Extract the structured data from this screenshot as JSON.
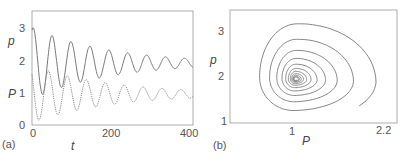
{
  "chart_data": [
    {
      "panel_label": "(a)",
      "type": "line",
      "title": "",
      "xlabel": "t",
      "ylabel_series": [
        "p",
        "P"
      ],
      "xlim": [
        0,
        400
      ],
      "ylim": [
        0,
        3.5
      ],
      "xticks": [
        "0",
        "200",
        "400"
      ],
      "yticks": [
        "0",
        "1",
        "2",
        "3"
      ],
      "grid": false,
      "legend": "none (series labeled on y-axis)",
      "series": [
        {
          "name": "p",
          "style": "solid",
          "description": "damped oscillation converging to ~1.9",
          "peaks": [
            [
              3,
              3.25
            ],
            [
              50,
              2.95
            ],
            [
              98,
              2.72
            ],
            [
              145,
              2.55
            ],
            [
              190,
              2.42
            ],
            [
              238,
              2.33
            ],
            [
              285,
              2.25
            ],
            [
              332,
              2.2
            ],
            [
              378,
              2.15
            ]
          ],
          "troughs": [
            [
              25,
              1.05
            ],
            [
              73,
              1.2
            ],
            [
              120,
              1.35
            ],
            [
              167,
              1.45
            ],
            [
              213,
              1.55
            ],
            [
              260,
              1.65
            ],
            [
              307,
              1.7
            ],
            [
              354,
              1.78
            ],
            [
              400,
              1.85
            ]
          ],
          "equilibrium": 1.9
        },
        {
          "name": "P",
          "style": "dotted",
          "description": "damped oscillation converging to ~0.95, lagging p",
          "peaks": [
            [
              0,
              2.15
            ],
            [
              40,
              1.85
            ],
            [
              88,
              1.65
            ],
            [
              135,
              1.48
            ],
            [
              182,
              1.38
            ],
            [
              228,
              1.3
            ],
            [
              276,
              1.25
            ],
            [
              322,
              1.2
            ],
            [
              370,
              1.18
            ]
          ],
          "troughs": [
            [
              20,
              0.4
            ],
            [
              68,
              0.48
            ],
            [
              115,
              0.58
            ],
            [
              162,
              0.65
            ],
            [
              208,
              0.72
            ],
            [
              255,
              0.78
            ],
            [
              302,
              0.82
            ],
            [
              348,
              0.86
            ],
            [
              400,
              0.92
            ]
          ],
          "equilibrium": 0.95
        }
      ]
    },
    {
      "panel_label": "(b)",
      "type": "line",
      "title": "",
      "xlabel": "P",
      "ylabel": "p",
      "xticks": [
        "1",
        "2.2"
      ],
      "yticks": [
        "1",
        "2",
        "3"
      ],
      "xlim": [
        0.1,
        2.4
      ],
      "ylim": [
        1.0,
        3.45
      ],
      "grid": false,
      "description": "phase portrait: trajectory spirals inward to fixed point",
      "fixed_point": [
        1.0,
        1.95
      ],
      "start_point": [
        2.05,
        1.35
      ],
      "outer_loop_extent": {
        "P_min": 0.4,
        "P_max": 2.2,
        "p_min": 1.05,
        "p_max": 3.3
      }
    }
  ]
}
